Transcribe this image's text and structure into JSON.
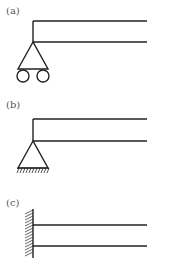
{
  "panels": [
    {
      "label": "(a)",
      "support": "roller-pin",
      "description": "L-frame on pin support with rollers"
    },
    {
      "label": "(b)",
      "support": "pin-fixed",
      "description": "L-frame on pin support with hatched ground"
    },
    {
      "label": "(c)",
      "support": "fixed-wall",
      "description": "Two beams cantilevered from hatched wall"
    }
  ],
  "colors": {
    "line": "#222222",
    "label": "#555555",
    "hatch": "#444444"
  }
}
